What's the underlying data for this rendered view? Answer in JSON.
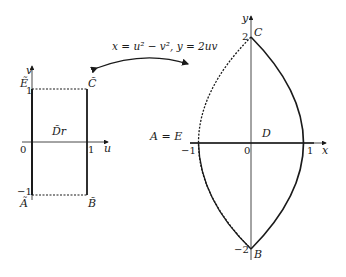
{
  "mapping": {
    "label": "x = u² − v², y = 2uv"
  },
  "left_plot": {
    "axis_u": "u",
    "axis_v": "v",
    "region_label": "D̃r",
    "ticks": {
      "origin": "0",
      "u_one": "1",
      "v_one": "1",
      "v_neg_one": "−1"
    },
    "vertices": {
      "E": "Ẽ",
      "C": "C̃",
      "A": "Ã",
      "B": "B̃"
    }
  },
  "right_plot": {
    "axis_x": "x",
    "axis_y": "y",
    "region_label": "D",
    "ticks": {
      "origin": "0",
      "x_one": "1",
      "x_neg_one": "−1",
      "y_two": "2",
      "y_neg_two": "−2"
    },
    "vertices": {
      "AE": "A = E",
      "C": "C",
      "B": "B"
    }
  },
  "colors": {
    "stroke": "#1a1a1a"
  }
}
